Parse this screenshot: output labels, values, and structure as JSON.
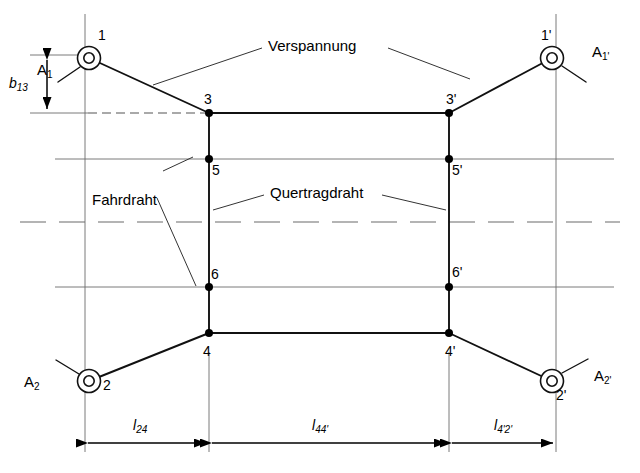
{
  "figure": {
    "colors": {
      "line": "#1a1a1a",
      "thin_line": "#555555",
      "background": "#ffffff",
      "text": "#000000"
    }
  },
  "annotations": {
    "verspannung": "Verspannung",
    "fahrdraht": "Fahrdraht",
    "quertragdraht": "Quertragdraht"
  },
  "nodes": {
    "n1": "1",
    "n1p": "1'",
    "n2": "2",
    "n2p": "2'",
    "n3": "3",
    "n3p": "3'",
    "n4": "4",
    "n4p": "4'",
    "n5": "5",
    "n5p": "5'",
    "n6": "6",
    "n6p": "6'"
  },
  "terminals": {
    "a1": {
      "base": "A",
      "sub": "1"
    },
    "a1p": {
      "base": "A",
      "sub": "1'"
    },
    "a2": {
      "base": "A",
      "sub": "2"
    },
    "a2p": {
      "base": "A",
      "sub": "2'"
    }
  },
  "dimensions": {
    "b13": {
      "base": "b",
      "sub": "13"
    },
    "l24": {
      "base": "l",
      "sub": "24"
    },
    "l44p": {
      "base": "l",
      "sub": "44'"
    },
    "l4p2p": {
      "base": "l",
      "sub": "4'2'"
    }
  }
}
